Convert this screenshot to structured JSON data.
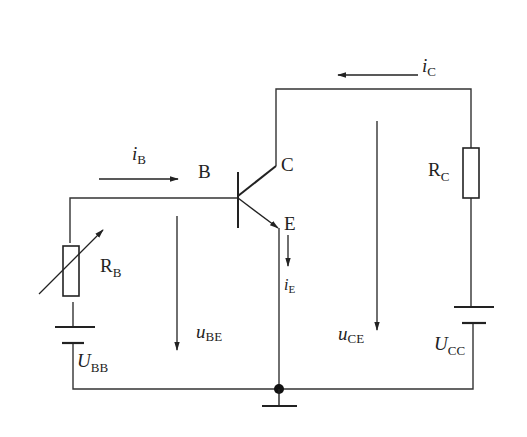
{
  "diagram": {
    "components": {
      "transistor": {
        "base_label": "B",
        "collector_label": "C",
        "emitter_label": "E"
      },
      "base_resistor": {
        "symbol": "R",
        "subscript": "B",
        "variable": true
      },
      "collector_resistor": {
        "symbol": "R",
        "subscript": "C"
      },
      "base_supply": {
        "symbol": "U",
        "subscript": "BB"
      },
      "collector_supply": {
        "symbol": "U",
        "subscript": "CC"
      },
      "ground": {
        "type": "ground"
      }
    },
    "currents": {
      "ib": {
        "symbol": "i",
        "subscript": "B",
        "direction": "right"
      },
      "ic": {
        "symbol": "i",
        "subscript": "C",
        "direction": "left"
      },
      "ie": {
        "symbol": "i",
        "subscript": "E",
        "direction": "down"
      }
    },
    "voltages": {
      "ube": {
        "symbol": "u",
        "subscript": "BE",
        "direction": "down"
      },
      "uce": {
        "symbol": "u",
        "subscript": "CE",
        "direction": "down"
      }
    }
  }
}
